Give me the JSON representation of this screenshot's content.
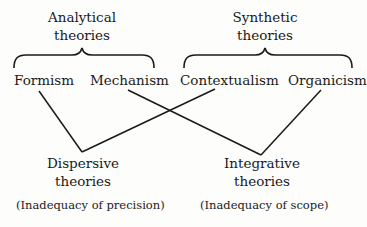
{
  "diagram": {
    "groups": {
      "analytical": {
        "line1": "Analytical",
        "line2": "theories"
      },
      "synthetic": {
        "line1": "Synthetic",
        "line2": "theories"
      }
    },
    "nodes": {
      "formism": "Formism",
      "mechanism": "Mechanism",
      "contextualism": "Contextualism",
      "organicism": "Organicism"
    },
    "outcomes": {
      "dispersive": {
        "line1": "Dispersive",
        "line2": "theories",
        "note": "(Inadequacy of precision)"
      },
      "integrative": {
        "line1": "Integrative",
        "line2": "theories",
        "note": "(Inadequacy of scope)"
      }
    },
    "edges": [
      {
        "from": "Formism",
        "to": "Dispersive theories"
      },
      {
        "from": "Contextualism",
        "to": "Dispersive theories"
      },
      {
        "from": "Mechanism",
        "to": "Integrative theories"
      },
      {
        "from": "Organicism",
        "to": "Integrative theories"
      }
    ],
    "line_color": "#1a1a1a"
  }
}
